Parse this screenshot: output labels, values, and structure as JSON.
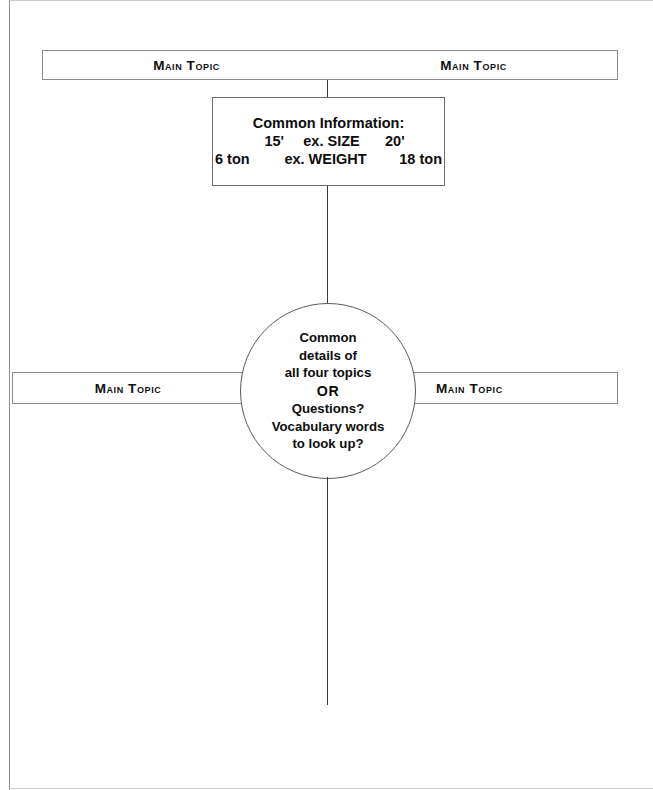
{
  "diagram": {
    "type": "compare-contrast-organizer",
    "page": {
      "width": 653,
      "height": 790,
      "background": "#ffffff",
      "line_color": "#3a3a3a",
      "text_color": "#0d0d0d"
    },
    "top_bar": {
      "left_label": "Main Topic",
      "right_label": "Main Topic"
    },
    "info_box": {
      "title": "Common Information:",
      "rows": [
        {
          "left": "15'",
          "middle": "ex. SIZE",
          "right": "20'"
        },
        {
          "left": "6 ton",
          "middle": "ex. WEIGHT",
          "right": "18 ton"
        }
      ]
    },
    "middle_bars": {
      "left_label": "Main Topic",
      "right_label": "Main Topic"
    },
    "center_circle": {
      "lines": [
        "Common",
        "details of",
        "all four topics",
        "OR",
        "Questions?",
        "Vocabulary words",
        "to look up?"
      ],
      "emphasis_line_index": 3
    }
  }
}
